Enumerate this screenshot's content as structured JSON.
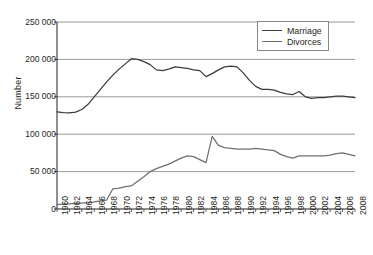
{
  "chart_data": {
    "type": "line",
    "title": "",
    "xlabel": "",
    "ylabel": "Number",
    "ylim": [
      0,
      250000
    ],
    "ytick_values": [
      0,
      50000,
      100000,
      150000,
      200000,
      250000
    ],
    "ytick_labels": [
      "0",
      "50 000",
      "100 000",
      "150 000",
      "200 000",
      "250 000"
    ],
    "grid": true,
    "grid_axis": "y",
    "legend_position": "top-right",
    "xlim": [
      1960,
      2008
    ],
    "xtick_labels": [
      "1960",
      "1962",
      "1964",
      "1966",
      "1968",
      "1970",
      "1972",
      "1974",
      "1976",
      "1978",
      "1980",
      "1982",
      "1984",
      "1986",
      "1988",
      "1990",
      "1992",
      "1994",
      "1996",
      "1998",
      "2000",
      "2002",
      "2004",
      "2006",
      "2008"
    ],
    "x": [
      1960,
      1961,
      1962,
      1963,
      1964,
      1965,
      1966,
      1967,
      1968,
      1969,
      1970,
      1971,
      1972,
      1973,
      1974,
      1975,
      1976,
      1977,
      1978,
      1979,
      1980,
      1981,
      1982,
      1983,
      1984,
      1985,
      1986,
      1987,
      1988,
      1989,
      1990,
      1991,
      1992,
      1993,
      1994,
      1995,
      1996,
      1997,
      1998,
      1999,
      2000,
      2001,
      2002,
      2003,
      2004,
      2005,
      2006,
      2007,
      2008
    ],
    "series": [
      {
        "name": "Marriage",
        "color": "#3b3b3b",
        "values": [
          130000,
          129000,
          128500,
          129500,
          133000,
          140000,
          150000,
          160000,
          170000,
          179000,
          187000,
          194000,
          201000,
          200000,
          197000,
          193000,
          186000,
          185000,
          187000,
          190000,
          189000,
          188000,
          186000,
          185000,
          177000,
          181000,
          186000,
          190000,
          191000,
          190000,
          182000,
          172000,
          164000,
          160000,
          160000,
          159000,
          156000,
          154000,
          153000,
          157000,
          150000,
          148000,
          149000,
          149000,
          150000,
          151000,
          151000,
          150000,
          149000
        ]
      },
      {
        "name": "Divorces",
        "color": "#6f6f6f",
        "values": [
          6000,
          6500,
          7000,
          7500,
          8000,
          8500,
          9500,
          11000,
          12000,
          27000,
          28000,
          30000,
          31000,
          37000,
          43000,
          50000,
          54000,
          57000,
          60000,
          64000,
          68000,
          71000,
          70000,
          66000,
          62000,
          97000,
          85000,
          82000,
          81000,
          80000,
          80000,
          80000,
          81000,
          80000,
          79000,
          78000,
          73000,
          70000,
          68000,
          71000,
          71000,
          71000,
          71000,
          71000,
          72000,
          74000,
          75000,
          73000,
          71000
        ]
      }
    ]
  },
  "legend": {
    "items": [
      {
        "label": "Marriage"
      },
      {
        "label": "Divorces"
      }
    ]
  }
}
